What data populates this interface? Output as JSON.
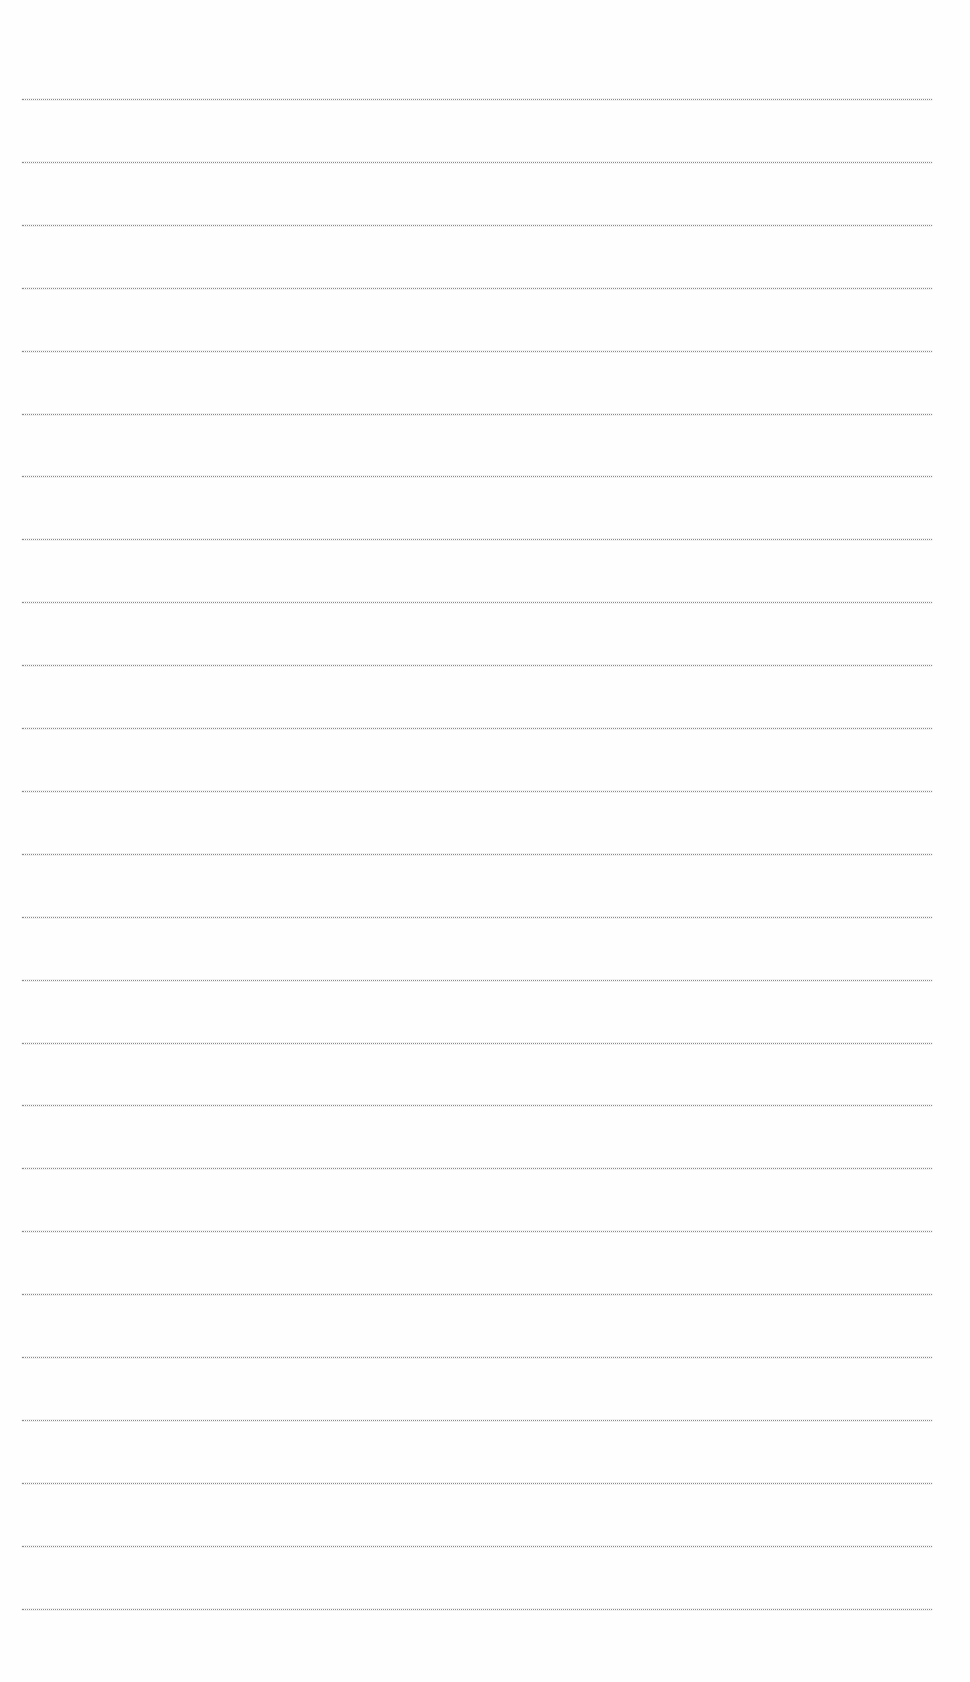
{
  "document": {
    "type": "ruled-paper",
    "background_color": "#fefefe",
    "line_color": "#8a8a8a",
    "line_count": 25,
    "first_line_y": 99,
    "line_spacing": 62.9,
    "line_left": 22,
    "line_right": 932,
    "text": []
  }
}
